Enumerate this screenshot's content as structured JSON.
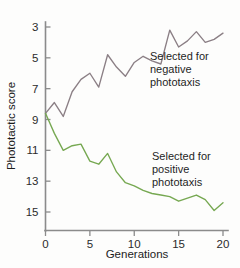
{
  "chart_data": {
    "type": "line",
    "title": "",
    "xlabel": "Generations",
    "ylabel": "Phototactic score",
    "xlim": [
      0,
      20
    ],
    "ylim": [
      15,
      3
    ],
    "y_axis_inverted": true,
    "grid": false,
    "legend_position": "inline-annotation",
    "xticks": [
      "0",
      "5",
      "10",
      "15",
      "20"
    ],
    "xtick_values": [
      0,
      5,
      10,
      15,
      20
    ],
    "yticks": [
      "3",
      "5",
      "7",
      "9",
      "11",
      "13",
      "15"
    ],
    "ytick_values": [
      3,
      5,
      7,
      9,
      11,
      13,
      15
    ],
    "x": [
      0,
      1,
      2,
      3,
      4,
      5,
      6,
      7,
      8,
      9,
      10,
      11,
      12,
      13,
      14,
      15,
      16,
      17,
      18,
      19,
      20
    ],
    "series": [
      {
        "name": "Selected for negative phototaxis",
        "color": "#8b7f85",
        "values": [
          8.6,
          7.9,
          8.8,
          7.2,
          6.4,
          6.0,
          6.9,
          4.8,
          5.6,
          6.2,
          5.3,
          4.9,
          5.2,
          5.4,
          3.2,
          4.3,
          3.9,
          3.3,
          4.0,
          3.8,
          3.4
        ]
      },
      {
        "name": "Selected for positive phototaxis",
        "color": "#76a851",
        "values": [
          8.6,
          9.9,
          11.0,
          10.7,
          10.6,
          11.7,
          11.9,
          11.2,
          12.4,
          13.1,
          13.3,
          13.6,
          13.8,
          13.9,
          14.0,
          14.3,
          14.1,
          13.9,
          14.2,
          14.9,
          14.4
        ]
      }
    ],
    "annotations": [
      {
        "id": "negative-phototaxis-label",
        "lines": [
          "Selected for",
          "negative",
          "phototaxis"
        ],
        "x": 150,
        "y": 60
      },
      {
        "id": "positive-phototaxis-label",
        "lines": [
          "Selected for",
          "positive",
          "phototaxis"
        ],
        "x": 152,
        "y": 160
      }
    ]
  },
  "axes": {
    "y_label": "Phototactic score",
    "x_label": "Generations"
  },
  "colors": {
    "negative_series": "#8b7f85",
    "positive_series": "#76a851",
    "axis": "#8b8b8b",
    "text": "#1c1c1c",
    "background": "#fdfdfc"
  }
}
